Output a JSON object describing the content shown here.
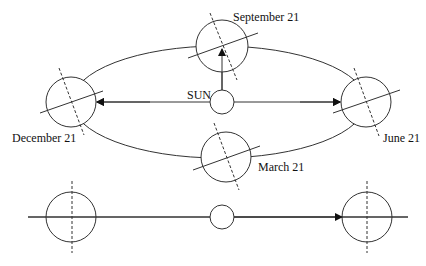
{
  "labels": {
    "sun": "SUN",
    "september": "September 21",
    "december": "December 21",
    "june": "June 21",
    "march": "March 21"
  },
  "colors": {
    "line": "#333333",
    "text": "#111111",
    "background": "#ffffff"
  },
  "orbit": {
    "cx": 219,
    "cy": 102,
    "rx": 147,
    "ry": 56
  },
  "earths_orbit": [
    {
      "name": "september",
      "cx": 222,
      "cy": 46,
      "r": 26
    },
    {
      "name": "december",
      "cx": 71,
      "cy": 102,
      "r": 25
    },
    {
      "name": "june",
      "cx": 366,
      "cy": 102,
      "r": 25
    },
    {
      "name": "march",
      "cx": 226,
      "cy": 157,
      "r": 25
    }
  ],
  "sun_top": {
    "cx": 222,
    "cy": 102,
    "r": 12
  },
  "bottom_row": {
    "y": 217,
    "left_earth": {
      "cx": 71,
      "r": 25
    },
    "sun": {
      "cx": 222,
      "r": 12
    },
    "right_earth": {
      "cx": 367,
      "r": 25
    }
  }
}
